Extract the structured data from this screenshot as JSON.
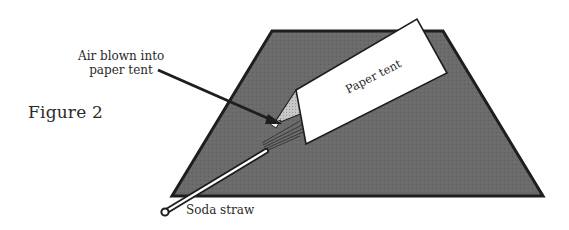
{
  "figure": {
    "title": "Figure 2",
    "labels": {
      "air": [
        "Air blown into",
        "paper tent"
      ],
      "tent": "Paper tent",
      "straw": "Soda straw"
    },
    "colors": {
      "surface_fill": "#6b6b6b",
      "outline": "#222222",
      "tent_face": "#ffffff",
      "tent_end": "#c4c4c4",
      "straw_fill": "#ffffff",
      "background": "#ffffff"
    }
  }
}
